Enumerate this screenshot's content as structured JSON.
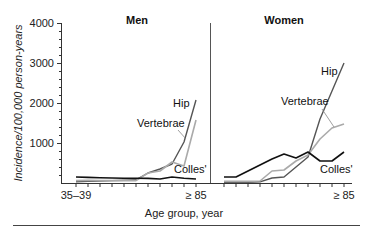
{
  "chart_data": [
    {
      "type": "line",
      "title": "Men",
      "xlabel": "Age group, year",
      "ylabel": "Incidence/100,000 person-years",
      "ylim": [
        0,
        4000
      ],
      "yticks": [
        1000,
        2000,
        3000,
        4000
      ],
      "categories": [
        "35–39",
        "40–44",
        "45–49",
        "50–54",
        "55–59",
        "60–64",
        "65–69",
        "70–74",
        "75–79",
        "80–84",
        "≥ 85"
      ],
      "xtick_labels_shown": [
        "35–39",
        "≥ 85"
      ],
      "series": [
        {
          "name": "Hip",
          "color": "#555555",
          "values": [
            30,
            40,
            50,
            60,
            70,
            80,
            250,
            350,
            475,
            1025,
            2075
          ]
        },
        {
          "name": "Vertebrae",
          "color": "#aaaaaa",
          "values": [
            60,
            70,
            60,
            60,
            60,
            60,
            250,
            300,
            525,
            425,
            1575
          ]
        },
        {
          "name": "Colles'",
          "color": "#111111",
          "values": [
            150,
            140,
            130,
            125,
            120,
            120,
            115,
            100,
            150,
            120,
            100
          ]
        }
      ],
      "grid": false
    },
    {
      "type": "line",
      "title": "Women",
      "xlabel": "Age group, year",
      "ylabel": "Incidence/100,000 person-years",
      "ylim": [
        0,
        4000
      ],
      "categories": [
        "35–39",
        "40–44",
        "45–49",
        "50–54",
        "55–59",
        "60–64",
        "65–69",
        "70–74",
        "75–79",
        "80–84",
        "≥ 85"
      ],
      "xtick_labels_shown": [
        "≥ 85"
      ],
      "series": [
        {
          "name": "Hip",
          "color": "#555555",
          "values": [
            20,
            20,
            20,
            30,
            125,
            150,
            400,
            650,
            1600,
            2300,
            3000
          ]
        },
        {
          "name": "Vertebrae",
          "color": "#aaaaaa",
          "values": [
            40,
            40,
            40,
            50,
            300,
            325,
            550,
            700,
            1100,
            1375,
            1475
          ]
        },
        {
          "name": "Colles'",
          "color": "#111111",
          "values": [
            150,
            150,
            300,
            450,
            600,
            725,
            625,
            775,
            550,
            550,
            775
          ]
        }
      ],
      "grid": false
    }
  ],
  "labels": {
    "men_title": "Men",
    "women_title": "Women",
    "y_axis": "Incidence/100,000 person-years",
    "x_axis": "Age group, year",
    "y_ticks": [
      "4000",
      "3000",
      "2000",
      "1000"
    ],
    "men_x_first": "35–39",
    "men_x_last": "≥ 85",
    "women_x_last": "≥ 85",
    "men_hip": "Hip",
    "men_vertebrae": "Vertebrae",
    "men_colles": "Colles'",
    "women_hip": "Hip",
    "women_vertebrae": "Vertebrae",
    "women_colles": "Colles'"
  }
}
